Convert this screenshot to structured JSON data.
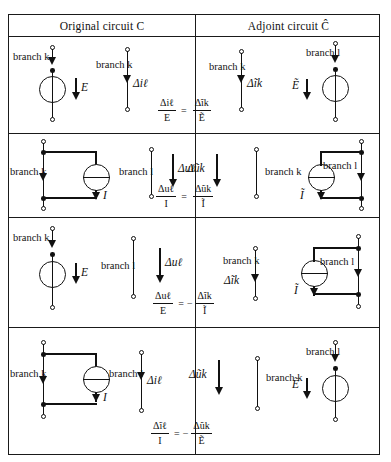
{
  "table": {
    "headers": {
      "left": "Original circuit C",
      "right": "Adjoint circuit Ĉ"
    },
    "rows": [
      {
        "id": "row-1",
        "left_circuit": {
          "branch_label": "branch k",
          "source_type": "voltage-source",
          "source_symbol": "E"
        },
        "left_measure": {
          "branch_label": "branch k",
          "quantity": "Δiℓ"
        },
        "equation": {
          "lhs_num": "Δiℓ",
          "lhs_den": "E",
          "operator": "=",
          "sign": "",
          "rhs_num": "Δĩk",
          "rhs_den": "Ẽ"
        },
        "right_measure": {
          "branch_label": "branch k",
          "quantity": "Δĩk"
        },
        "right_circuit": {
          "branch_label": "branch l",
          "source_type": "voltage-source",
          "source_symbol": "Ẽ"
        }
      },
      {
        "id": "row-2",
        "left_circuit": {
          "branch_label": "branch k",
          "source_type": "current-source",
          "source_symbol": "I"
        },
        "left_measure": {
          "branch_label": "branch l",
          "quantity": "Δuℓ"
        },
        "equation": {
          "lhs_num": "Δuℓ",
          "lhs_den": "I",
          "operator": "=",
          "sign": "",
          "rhs_num": "Δũk",
          "rhs_den": "Ĩ"
        },
        "right_measure": {
          "branch_label": "branch k",
          "quantity": "Δũk"
        },
        "right_circuit": {
          "branch_label": "branch l",
          "source_type": "current-source",
          "source_symbol": "Ĩ"
        }
      },
      {
        "id": "row-3",
        "left_circuit": {
          "branch_label": "branch k",
          "source_type": "voltage-source",
          "source_symbol": "E"
        },
        "left_measure": {
          "branch_label": "branch l",
          "quantity": "Δuℓ"
        },
        "equation": {
          "lhs_num": "Δuℓ",
          "lhs_den": "E",
          "operator": "=",
          "sign": "−",
          "rhs_num": "Δĩk",
          "rhs_den": "Ĩ"
        },
        "right_measure": {
          "branch_label": "branch k",
          "quantity": "Δĩk"
        },
        "right_circuit": {
          "branch_label": "branch l",
          "source_type": "current-source",
          "source_symbol": "Ĩ"
        }
      },
      {
        "id": "row-4",
        "left_circuit": {
          "branch_label": "branch k",
          "source_type": "current-source",
          "source_symbol": "I"
        },
        "left_measure": {
          "branch_label": "branch l",
          "quantity": "Δiℓ"
        },
        "equation": {
          "lhs_num": "Δĩℓ",
          "lhs_den": "I",
          "operator": "=",
          "sign": "−",
          "rhs_num": "Δũk",
          "rhs_den": "Ẽ"
        },
        "right_measure": {
          "branch_label": "branch k",
          "quantity": "Δũk"
        },
        "right_circuit": {
          "branch_label": "branch l",
          "source_type": "voltage-source",
          "source_symbol": "Ẽ"
        }
      }
    ]
  },
  "colors": {
    "ink": "#111111",
    "paper": "#ffffff"
  }
}
